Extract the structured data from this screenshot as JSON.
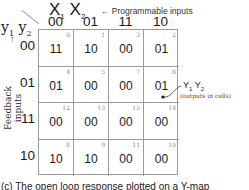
{
  "header": {
    "x_vars": {
      "x1": "X",
      "x1_sub": "1",
      "x2": "X",
      "x2_sub": "2"
    },
    "programmable_note": "← Programmable inputs",
    "y_vars": {
      "y1": "y",
      "y1_sub": "1",
      "y2": "y",
      "y2_sub": "2"
    }
  },
  "columns": [
    "00",
    "01",
    "11",
    "10"
  ],
  "rows": [
    "00",
    "01",
    "11",
    "10"
  ],
  "side_label": "Feedback inputs",
  "side_arrow": "↑",
  "cells": [
    [
      {
        "idx": "0",
        "val": "11"
      },
      {
        "idx": "1",
        "val": "10"
      },
      {
        "idx": "3",
        "val": "00"
      },
      {
        "idx": "2",
        "val": "01"
      }
    ],
    [
      {
        "idx": "4",
        "val": "01"
      },
      {
        "idx": "5",
        "val": "00"
      },
      {
        "idx": "7",
        "val": "00"
      },
      {
        "idx": "6",
        "val": "01"
      }
    ],
    [
      {
        "idx": "12",
        "val": "00"
      },
      {
        "idx": "13",
        "val": "00"
      },
      {
        "idx": "15",
        "val": "00"
      },
      {
        "idx": "14",
        "val": "00"
      }
    ],
    [
      {
        "idx": "8",
        "val": "10"
      },
      {
        "idx": "9",
        "val": "10"
      },
      {
        "idx": "11",
        "val": "00"
      },
      {
        "idx": "10",
        "val": "00"
      }
    ]
  ],
  "callout": {
    "label_y1": "Y",
    "label_y1_sub": "1",
    "label_y2": "Y",
    "label_y2_sub": "2",
    "note": "(outputs in cells)"
  },
  "caption": "(c) The open loop response plotted on a Y-map"
}
